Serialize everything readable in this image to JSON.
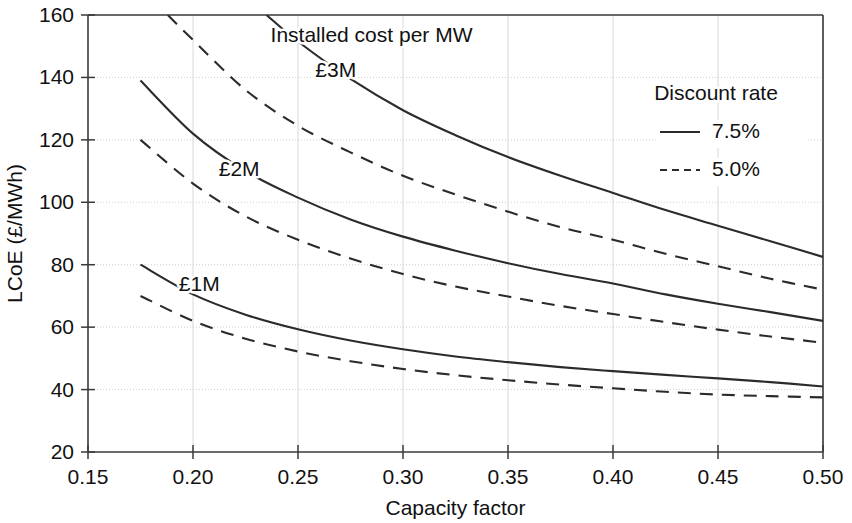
{
  "chart_data": {
    "type": "line",
    "title": "",
    "xlabel": "Capacity factor",
    "ylabel": "LCoE (£/MWh)",
    "xlim": [
      0.15,
      0.5
    ],
    "ylim": [
      20,
      160
    ],
    "xticks": [
      "0.15",
      "0.20",
      "0.25",
      "0.30",
      "0.35",
      "0.40",
      "0.45",
      "0.50"
    ],
    "xtick_values": [
      0.15,
      0.2,
      0.25,
      0.3,
      0.35,
      0.4,
      0.45,
      0.5
    ],
    "yticks": [
      "20",
      "40",
      "60",
      "80",
      "100",
      "120",
      "140",
      "160"
    ],
    "ytick_values": [
      20,
      40,
      60,
      80,
      100,
      120,
      140,
      160
    ],
    "grid": true,
    "legend_position": "top-right",
    "legend_title": "Discount rate",
    "annotations": [
      {
        "text": "Installed cost per MW",
        "x": 0.285,
        "y": 151.5
      },
      {
        "text": "£3M",
        "x": 0.268,
        "y": 140.0
      },
      {
        "text": "£2M",
        "x": 0.222,
        "y": 108.5
      },
      {
        "text": "£1M",
        "x": 0.203,
        "y": 71.5
      }
    ],
    "series": [
      {
        "name": "£1M – 7.5%",
        "cost": "£1M",
        "discount_rate": "7.5%",
        "style": "solid",
        "x": [
          0.175,
          0.2,
          0.225,
          0.25,
          0.275,
          0.3,
          0.325,
          0.35,
          0.375,
          0.4,
          0.425,
          0.45,
          0.475,
          0.5
        ],
        "values": [
          80.0,
          70.5,
          64.0,
          59.3,
          55.7,
          52.9,
          50.6,
          48.8,
          47.2,
          45.9,
          44.7,
          43.6,
          42.4,
          41.0
        ]
      },
      {
        "name": "£1M – 5.0%",
        "cost": "£1M",
        "discount_rate": "5.0%",
        "style": "dashed",
        "x": [
          0.175,
          0.2,
          0.225,
          0.25,
          0.275,
          0.3,
          0.325,
          0.35,
          0.375,
          0.4,
          0.425,
          0.45,
          0.475,
          0.5
        ],
        "values": [
          70.0,
          62.0,
          56.3,
          52.2,
          49.1,
          46.6,
          44.6,
          43.0,
          41.6,
          40.4,
          39.3,
          38.4,
          37.9,
          37.5
        ]
      },
      {
        "name": "£2M – 7.5%",
        "cost": "£2M",
        "discount_rate": "7.5%",
        "style": "solid",
        "x": [
          0.175,
          0.2,
          0.225,
          0.25,
          0.275,
          0.3,
          0.325,
          0.35,
          0.375,
          0.4,
          0.425,
          0.45,
          0.475,
          0.5
        ],
        "values": [
          139.0,
          122.0,
          110.0,
          101.5,
          94.5,
          89.0,
          84.5,
          80.5,
          77.0,
          74.0,
          70.5,
          67.5,
          64.8,
          62.0
        ]
      },
      {
        "name": "£2M – 5.0%",
        "cost": "£2M",
        "discount_rate": "5.0%",
        "style": "dashed",
        "x": [
          0.175,
          0.2,
          0.225,
          0.25,
          0.275,
          0.3,
          0.325,
          0.35,
          0.375,
          0.4,
          0.425,
          0.45,
          0.475,
          0.5
        ],
        "values": [
          120.0,
          106.0,
          95.5,
          88.0,
          82.0,
          77.0,
          73.0,
          69.8,
          66.8,
          64.2,
          61.6,
          59.2,
          57.0,
          55.0
        ]
      },
      {
        "name": "£3M – 7.5%",
        "cost": "£3M",
        "discount_rate": "7.5%",
        "style": "solid",
        "x": [
          0.235,
          0.25,
          0.275,
          0.3,
          0.325,
          0.35,
          0.375,
          0.4,
          0.425,
          0.45,
          0.475,
          0.5
        ],
        "values": [
          160.0,
          151.5,
          139.5,
          129.5,
          121.5,
          114.5,
          108.5,
          103.0,
          97.5,
          92.5,
          87.5,
          82.5
        ]
      },
      {
        "name": "£3M – 5.0%",
        "cost": "£3M",
        "discount_rate": "5.0%",
        "style": "dashed",
        "x": [
          0.188,
          0.2,
          0.225,
          0.25,
          0.275,
          0.3,
          0.325,
          0.35,
          0.375,
          0.4,
          0.425,
          0.45,
          0.475,
          0.5
        ],
        "values": [
          160.0,
          152.0,
          136.0,
          124.5,
          116.0,
          108.5,
          102.5,
          97.0,
          92.0,
          88.0,
          83.5,
          79.5,
          75.5,
          72.0
        ]
      }
    ],
    "legend_entries": [
      {
        "label": "7.5%",
        "style": "solid"
      },
      {
        "label": "5.0%",
        "style": "dashed"
      }
    ]
  }
}
